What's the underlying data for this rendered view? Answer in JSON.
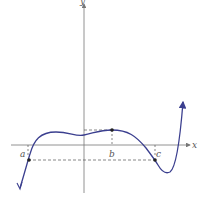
{
  "figure": {
    "axes": {
      "x_label": "x",
      "y_label": "y"
    },
    "points": [
      {
        "label": "a",
        "description": "left point on curve below x-axis"
      },
      {
        "label": "b",
        "description": "local maximum on curve"
      },
      {
        "label": "c",
        "description": "point on curve at same height as a"
      }
    ],
    "colors": {
      "curve": "#3b3f8f",
      "axes": "#777777",
      "dashed": "#555555"
    }
  }
}
